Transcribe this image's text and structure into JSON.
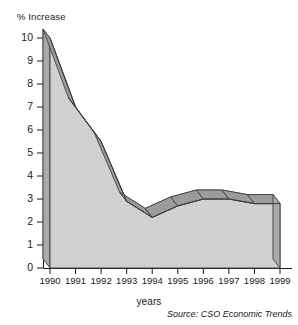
{
  "chart_data": {
    "type": "area",
    "title": "",
    "subtitle": "",
    "ylabel": "% Increase",
    "xlabel": "years",
    "categories": [
      "1990",
      "1991",
      "1992",
      "1993",
      "1994",
      "1995",
      "1996",
      "1997",
      "1998",
      "1999"
    ],
    "values": [
      10.0,
      7.0,
      5.5,
      2.9,
      2.2,
      2.7,
      3.0,
      3.0,
      2.8,
      2.8
    ],
    "series": [
      {
        "name": "% Increase",
        "values": [
          10.0,
          7.0,
          5.5,
          2.9,
          2.2,
          2.7,
          3.0,
          3.0,
          2.8,
          2.8
        ]
      }
    ],
    "ylim": [
      0,
      10
    ],
    "yticks": [
      0,
      1,
      2,
      3,
      4,
      5,
      6,
      7,
      8,
      9,
      10
    ],
    "ytick_labels": [
      "0",
      "1",
      "2",
      "3",
      "4",
      "5",
      "6",
      "7",
      "8",
      "9",
      "10"
    ],
    "grid": false,
    "legend": false,
    "legend_position": "none",
    "annotations": [
      "Source: CSO Economic Trends"
    ],
    "style": "3d-ribbon",
    "colors": {
      "ribbon_top": "#9a9a9a",
      "area_face": "#cfcfcf",
      "side_wall": "#a8a8a8",
      "outline": "#3c3c3c",
      "axis": "#1a1a1a"
    }
  },
  "axes": {
    "y_title": "% Increase",
    "x_title": "years"
  },
  "footer": {
    "source": "Source: CSO Economic Trends"
  }
}
